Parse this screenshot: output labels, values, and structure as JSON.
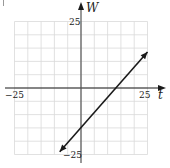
{
  "chart_data": {
    "type": "line",
    "title": "",
    "xlabel": "t",
    "ylabel": "W",
    "xlim": [
      -25,
      25
    ],
    "ylim": [
      -25,
      25
    ],
    "grid": true,
    "grid_step": 5,
    "tick_labels": {
      "x_min": "−25",
      "x_max": "25",
      "y_max": "25",
      "y_min": "−25"
    },
    "series": [
      {
        "name": "line",
        "color": "#1a1a1a",
        "arrows": "both",
        "points": [
          {
            "t": -8,
            "W": -24
          },
          {
            "t": 0,
            "W": -16.5
          },
          {
            "t": 13.75,
            "W": 0
          },
          {
            "t": 25,
            "W": 13.5
          }
        ]
      }
    ],
    "colors": {
      "grid": "#d9d9d9",
      "axis": "#1a1a1a",
      "line": "#1a1a1a"
    }
  }
}
